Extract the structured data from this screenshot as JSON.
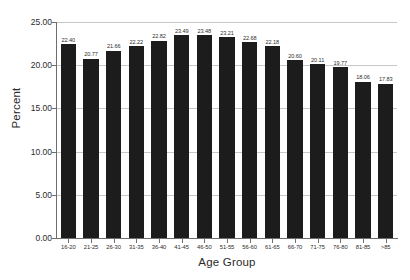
{
  "chart_data": {
    "type": "bar",
    "title": "",
    "subtitle": "",
    "xlabel": "Age Group",
    "ylabel": "Percent",
    "categories": [
      "16-20",
      "21-25",
      "26-30",
      "31-35",
      "36-40",
      "41-45",
      "46-50",
      "51-55",
      "56-60",
      "61-65",
      "66-70",
      "71-75",
      "76-80",
      "81-85",
      ">85"
    ],
    "values": [
      22.4,
      20.77,
      21.66,
      22.22,
      22.82,
      23.49,
      23.48,
      23.21,
      22.68,
      22.18,
      20.6,
      20.11,
      19.77,
      18.06,
      17.83
    ],
    "data_labels": [
      "22.40",
      "20.77",
      "21.66",
      "22.22",
      "22.82",
      "23.49",
      "23.48",
      "23.21",
      "22.68",
      "22.18",
      "20.60",
      "20.11",
      "19.77",
      "18.06",
      "17.83"
    ],
    "ylim": [
      0.0,
      25.0
    ],
    "ytick_values": [
      25.0,
      20.0,
      15.0,
      10.0,
      5.0,
      0.0
    ],
    "ytick_labels": [
      "25.00",
      "20.00",
      "15.00",
      "10.00",
      "5.00",
      "0.00"
    ],
    "grid": true,
    "grid_axis": "y",
    "legend": false,
    "legend_position": "none",
    "bar_color": "#1c1c1c",
    "grid_color": "#c8c8c8",
    "axis_color": "#6e6e6e",
    "background_color": "#ffffff",
    "text_color": "#2b2b2b"
  }
}
